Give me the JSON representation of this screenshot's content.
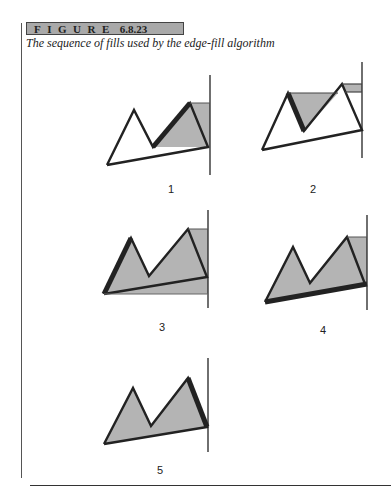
{
  "figure": {
    "label_word": "FIGURE",
    "label_number": "6.8.23",
    "caption": "The sequence of fills used by the edge-fill algorithm"
  },
  "colors": {
    "fill_gray": "#b4b4b4",
    "outline": "#222222",
    "header_bg": "#a9a9a9"
  },
  "panels": [
    {
      "label": "1"
    },
    {
      "label": "2"
    },
    {
      "label": "3"
    },
    {
      "label": "4"
    },
    {
      "label": "5"
    }
  ]
}
